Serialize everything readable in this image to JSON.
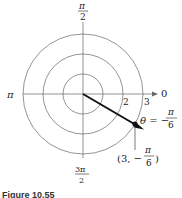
{
  "diagram": {
    "type": "polar-grid",
    "center": [
      83,
      94
    ],
    "radii": [
      1,
      2,
      3
    ],
    "ring_labels": [
      "2",
      "3"
    ],
    "axis_labels": {
      "right": "0",
      "left": "π",
      "top_num": "π",
      "top_den": "2",
      "bottom_num": "3π",
      "bottom_den": "2"
    },
    "ray": {
      "theta_label_prefix": "θ = −",
      "theta_num": "π",
      "theta_den": "6"
    },
    "point": {
      "label_open": "(3, −",
      "label_num": "π",
      "label_den": "6",
      "label_close": ")"
    },
    "caption": "Figure 10.55"
  }
}
